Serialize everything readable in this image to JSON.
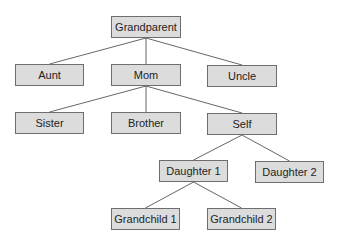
{
  "diagram": {
    "type": "family-tree",
    "colors": {
      "box_fill": "#dcdcdc",
      "box_border": "#6e6e6e",
      "link": "#555555",
      "text": "#1e1e1e"
    },
    "nodes": [
      {
        "id": "grandparent",
        "label": "Grandparent",
        "x": 111,
        "y": 16,
        "w": 70,
        "h": 22
      },
      {
        "id": "aunt",
        "label": "Aunt",
        "x": 15,
        "y": 64,
        "w": 69,
        "h": 22
      },
      {
        "id": "mom",
        "label": "Mom",
        "x": 111,
        "y": 64,
        "w": 70,
        "h": 22
      },
      {
        "id": "uncle",
        "label": "Uncle",
        "x": 207,
        "y": 65,
        "w": 70,
        "h": 22
      },
      {
        "id": "sister",
        "label": "Sister",
        "x": 15,
        "y": 112,
        "w": 69,
        "h": 22
      },
      {
        "id": "brother",
        "label": "Brother",
        "x": 111,
        "y": 112,
        "w": 70,
        "h": 22
      },
      {
        "id": "self",
        "label": "Self",
        "x": 207,
        "y": 113,
        "w": 70,
        "h": 22
      },
      {
        "id": "daughter1",
        "label": "Daughter 1",
        "x": 159,
        "y": 160,
        "w": 69,
        "h": 22
      },
      {
        "id": "daughter2",
        "label": "Daughter 2",
        "x": 255,
        "y": 161,
        "w": 69,
        "h": 22
      },
      {
        "id": "grandchild1",
        "label": "Grandchild 1",
        "x": 111,
        "y": 208,
        "w": 69,
        "h": 22
      },
      {
        "id": "grandchild2",
        "label": "Grandchild 2",
        "x": 207,
        "y": 208,
        "w": 69,
        "h": 22
      }
    ],
    "edges": [
      {
        "from": "grandparent",
        "to": "aunt"
      },
      {
        "from": "grandparent",
        "to": "mom"
      },
      {
        "from": "grandparent",
        "to": "uncle"
      },
      {
        "from": "mom",
        "to": "sister"
      },
      {
        "from": "mom",
        "to": "brother"
      },
      {
        "from": "mom",
        "to": "self"
      },
      {
        "from": "self",
        "to": "daughter1"
      },
      {
        "from": "self",
        "to": "daughter2"
      },
      {
        "from": "daughter1",
        "to": "grandchild1"
      },
      {
        "from": "daughter1",
        "to": "grandchild2"
      }
    ]
  }
}
